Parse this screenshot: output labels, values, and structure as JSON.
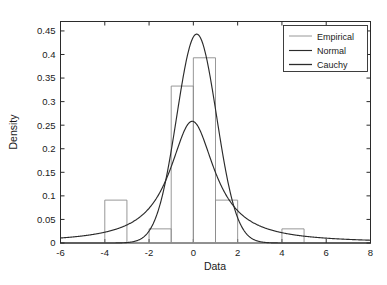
{
  "chart_data": {
    "type": "bar",
    "title": "",
    "xlabel": "Data",
    "ylabel": "Density",
    "xlim": [
      -6,
      8
    ],
    "ylim": [
      0,
      0.47
    ],
    "grid": false,
    "legend_position": "top-right",
    "xticks": [
      "-6",
      "-4",
      "-2",
      "0",
      "2",
      "4",
      "6",
      "8"
    ],
    "xtick_values": [
      -6,
      -4,
      -2,
      0,
      2,
      4,
      6,
      8
    ],
    "yticks": [
      "0",
      "0.05",
      "0.1",
      "0.15",
      "0.2",
      "0.25",
      "0.3",
      "0.35",
      "0.4",
      "0.45"
    ],
    "ytick_values": [
      0,
      0.05,
      0.1,
      0.15,
      0.2,
      0.25,
      0.3,
      0.35,
      0.4,
      0.45
    ],
    "legend": [
      {
        "label": "Empirical",
        "style": "histogram-outline",
        "color": "#8c8c8c"
      },
      {
        "label": "Normal",
        "style": "line",
        "color": "#2b2b2b"
      },
      {
        "label": "Cauchy",
        "style": "line",
        "color": "#2b2b2b"
      }
    ],
    "series": [
      {
        "name": "Empirical",
        "type": "histogram",
        "bin_width": 1,
        "bin_edges": [
          -4,
          -3,
          -2,
          -1,
          0,
          1,
          2,
          4,
          5
        ],
        "bins": [
          {
            "x0": -4,
            "x1": -3,
            "density": 0.091
          },
          {
            "x0": -3,
            "x1": -2,
            "density": 0
          },
          {
            "x0": -2,
            "x1": -1,
            "density": 0.03
          },
          {
            "x0": -1,
            "x1": 0,
            "density": 0.333
          },
          {
            "x0": 0,
            "x1": 1,
            "density": 0.393
          },
          {
            "x0": 1,
            "x1": 2,
            "density": 0.091
          },
          {
            "x0": 4,
            "x1": 5,
            "density": 0.03
          }
        ]
      },
      {
        "name": "Normal",
        "type": "line",
        "distribution": "normal",
        "peak_x": 0.15,
        "peak_y": 0.445,
        "mu": 0.15,
        "sigma": 0.9
      },
      {
        "name": "Cauchy",
        "type": "line",
        "distribution": "cauchy",
        "peak_x": -0.05,
        "peak_y": 0.258,
        "x0": -0.05,
        "gamma": 1.232
      }
    ]
  },
  "figure": {
    "background": "#ffffff",
    "axis_color": "#2b2b2b",
    "bar_color": "#8c8c8c",
    "curve_color": "#2b2b2b"
  }
}
